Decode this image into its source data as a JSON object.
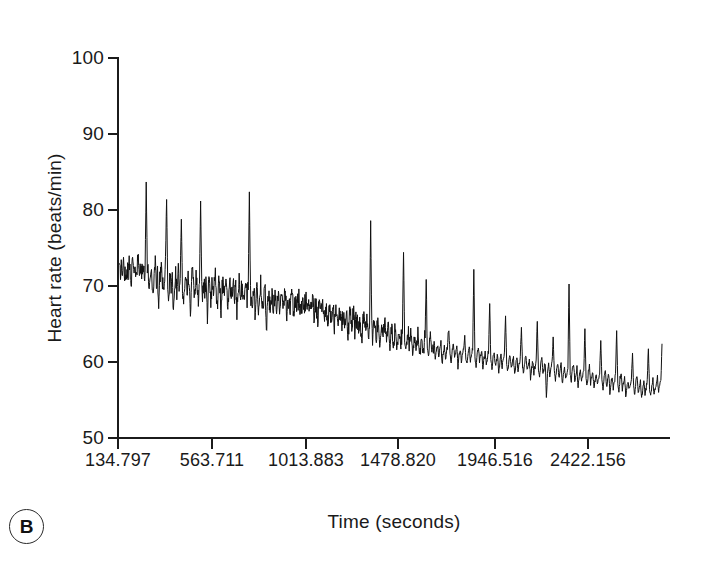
{
  "figure": {
    "panel_label": "B",
    "background": "#ffffff",
    "ink": "#1b1b1b"
  },
  "chart_data": {
    "type": "line",
    "title": "",
    "xlabel": "Time (seconds)",
    "ylabel": "Heart rate (beats/min)",
    "ylim": [
      50,
      100
    ],
    "yticks": [
      100,
      90,
      80,
      70,
      60,
      50
    ],
    "ytick_labels": [
      "100",
      "90",
      "80",
      "70",
      "60",
      "50"
    ],
    "xtick_labels": [
      "134.797",
      "563.711",
      "1013.883",
      "1478.820",
      "1946.516",
      "2422.156"
    ],
    "xtick_values": [
      134.797,
      563.711,
      1013.883,
      1478.82,
      1946.516,
      2422.156
    ],
    "xtick_pixel_positions": [
      118,
      212,
      306,
      398,
      495,
      588
    ],
    "grid": false,
    "legend": null,
    "series_name": "Heart rate",
    "line_color": "#111111",
    "line_width": 1,
    "units": "beats/min",
    "summary": {
      "start_value": 72,
      "end_value": 62,
      "max_value": 84,
      "min_value": 55,
      "trend": "decreasing"
    },
    "values": [
      72.4,
      71.6,
      72.9,
      71.2,
      73.1,
      72.0,
      71.0,
      72.6,
      71.5,
      73.4,
      72.1,
      70.8,
      73.0,
      71.9,
      72.8,
      70.6,
      72.2,
      74.0,
      71.3,
      72.5,
      70.9,
      73.6,
      71.8,
      72.0,
      83.7,
      72.6,
      71.0,
      70.2,
      72.4,
      71.1,
      69.0,
      71.5,
      73.2,
      70.4,
      72.0,
      66.1,
      70.8,
      72.9,
      71.4,
      69.6,
      71.0,
      73.8,
      81.4,
      70.2,
      68.3,
      71.6,
      70.0,
      72.3,
      65.8,
      70.4,
      71.9,
      69.1,
      72.2,
      70.6,
      71.1,
      78.9,
      70.0,
      68.4,
      70.9,
      72.1,
      69.5,
      71.3,
      70.1,
      66.0,
      70.8,
      72.4,
      70.2,
      69.0,
      71.0,
      70.4,
      68.1,
      70.6,
      81.1,
      70.0,
      68.8,
      70.2,
      69.4,
      71.2,
      65.3,
      69.8,
      70.6,
      68.4,
      70.0,
      69.2,
      70.8,
      71.4,
      69.0,
      68.2,
      70.1,
      69.6,
      67.0,
      69.8,
      70.4,
      68.6,
      70.0,
      69.1,
      67.4,
      69.9,
      70.6,
      68.0,
      69.4,
      70.2,
      68.8,
      70.0,
      66.2,
      69.0,
      70.4,
      68.2,
      69.6,
      70.1,
      67.8,
      69.2,
      70.0,
      68.4,
      69.8,
      82.7,
      69.0,
      67.2,
      68.9,
      70.0,
      66.8,
      68.6,
      69.4,
      67.5,
      69.0,
      70.2,
      68.0,
      66.4,
      68.8,
      69.5,
      63.4,
      68.0,
      69.2,
      67.4,
      68.6,
      69.0,
      66.9,
      68.2,
      69.4,
      67.0,
      68.5,
      69.1,
      66.2,
      68.0,
      68.9,
      67.2,
      68.4,
      69.0,
      66.4,
      67.8,
      68.6,
      67.0,
      68.2,
      68.8,
      66.0,
      67.6,
      68.4,
      67.1,
      68.0,
      68.6,
      66.6,
      67.4,
      68.1,
      66.8,
      67.8,
      68.3,
      66.2,
      67.0,
      67.9,
      66.4,
      67.4,
      68.0,
      66.0,
      67.2,
      67.8,
      65.4,
      66.8,
      67.6,
      66.2,
      67.0,
      67.4,
      65.8,
      66.6,
      67.2,
      65.2,
      66.4,
      67.0,
      65.6,
      66.2,
      66.9,
      64.9,
      66.0,
      66.8,
      65.4,
      66.2,
      67.0,
      64.6,
      65.8,
      66.4,
      65.0,
      66.0,
      66.6,
      63.8,
      65.4,
      66.2,
      64.8,
      65.8,
      66.4,
      64.2,
      65.6,
      66.0,
      64.4,
      65.2,
      65.8,
      62.0,
      64.8,
      65.4,
      64.0,
      65.0,
      65.6,
      63.4,
      64.6,
      78.3,
      64.2,
      63.0,
      64.8,
      65.4,
      63.6,
      64.4,
      65.0,
      61.8,
      64.0,
      64.8,
      63.2,
      64.2,
      65.0,
      62.6,
      63.8,
      64.6,
      62.0,
      63.4,
      64.2,
      62.8,
      63.6,
      64.4,
      61.4,
      63.0,
      63.8,
      62.4,
      63.2,
      64.0,
      74.6,
      62.8,
      61.6,
      63.4,
      64.0,
      62.2,
      63.0,
      63.6,
      61.0,
      62.6,
      63.4,
      61.8,
      62.8,
      63.6,
      60.8,
      62.2,
      63.0,
      61.4,
      62.4,
      63.2,
      70.2,
      62.0,
      60.6,
      62.6,
      63.2,
      61.2,
      62.0,
      62.8,
      60.2,
      61.6,
      62.4,
      60.8,
      61.8,
      62.6,
      59.6,
      61.2,
      62.0,
      60.4,
      61.4,
      62.2,
      64.0,
      61.0,
      60.0,
      61.6,
      62.4,
      60.6,
      61.2,
      62.0,
      59.2,
      60.8,
      61.6,
      60.0,
      61.0,
      61.8,
      63.2,
      60.4,
      59.8,
      61.2,
      62.0,
      60.2,
      61.0,
      61.8,
      72.0,
      60.6,
      59.4,
      61.0,
      61.8,
      60.2,
      60.8,
      61.6,
      59.0,
      60.4,
      61.2,
      59.8,
      60.6,
      61.4,
      68.0,
      60.0,
      59.2,
      60.8,
      61.4,
      59.6,
      60.2,
      61.0,
      58.6,
      60.0,
      60.8,
      59.4,
      60.2,
      61.0,
      66.4,
      59.8,
      58.8,
      60.4,
      61.0,
      59.2,
      60.0,
      60.6,
      58.2,
      59.6,
      60.4,
      59.0,
      59.8,
      60.6,
      64.8,
      59.4,
      58.4,
      60.0,
      60.8,
      59.0,
      59.6,
      60.4,
      57.8,
      59.2,
      60.0,
      58.6,
      59.4,
      60.2,
      65.4,
      59.0,
      58.0,
      59.6,
      60.4,
      58.4,
      59.2,
      60.0,
      55.0,
      58.8,
      59.6,
      58.2,
      59.0,
      59.8,
      63.6,
      58.6,
      57.6,
      59.2,
      60.0,
      58.0,
      58.8,
      59.6,
      57.2,
      58.4,
      59.2,
      57.8,
      58.6,
      59.4,
      70.6,
      58.2,
      57.4,
      59.0,
      59.8,
      57.6,
      58.4,
      59.2,
      56.8,
      58.0,
      58.8,
      57.4,
      58.2,
      59.0,
      64.2,
      57.8,
      57.0,
      58.6,
      59.4,
      57.2,
      58.0,
      58.8,
      56.4,
      57.6,
      58.4,
      57.0,
      57.8,
      58.6,
      62.8,
      57.4,
      56.6,
      58.2,
      59.0,
      56.8,
      57.6,
      58.4,
      56.0,
      57.2,
      58.0,
      56.6,
      57.4,
      58.2,
      64.0,
      57.0,
      56.2,
      57.8,
      58.6,
      56.4,
      57.2,
      58.0,
      55.6,
      56.8,
      57.6,
      56.2,
      57.0,
      57.8,
      61.4,
      56.6,
      55.8,
      57.4,
      58.2,
      56.0,
      56.8,
      57.6,
      55.2,
      56.4,
      57.2,
      55.8,
      56.6,
      57.4,
      62.0,
      56.2,
      55.4,
      57.0,
      57.8,
      55.6,
      56.4,
      57.2,
      58.0,
      56.0,
      56.8,
      57.6,
      62.4
    ]
  }
}
